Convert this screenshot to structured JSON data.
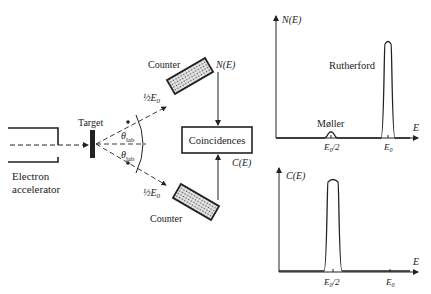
{
  "labels": {
    "target": "Target",
    "accelerator_line1": "Electron",
    "accelerator_line2": "accelerator",
    "counter_top": "Counter",
    "counter_bottom": "Counter",
    "half_e0_top": "½E",
    "half_e0_top_sub": "0",
    "half_e0_bottom": "½E",
    "half_e0_bottom_sub": "0",
    "theta_top": "θ",
    "theta_top_sub": "lab",
    "theta_bottom": "θ",
    "theta_bottom_sub": "lab",
    "ne_signal": "N(E)",
    "ce_signal": "C(E)",
    "coincidences": "Coincidences"
  },
  "chart_data": [
    {
      "type": "line",
      "title": "",
      "ylabel": "N(E)",
      "xlabel": "E",
      "xticks": [
        "E0/2",
        "E0"
      ],
      "annotations": [
        "Møller",
        "Rutherford"
      ],
      "peaks": [
        {
          "name": "Møller",
          "center": "E0/2",
          "relative_height": 0.06
        },
        {
          "name": "Rutherford",
          "center": "E0",
          "relative_height": 1.0
        }
      ]
    },
    {
      "type": "line",
      "title": "",
      "ylabel": "C(E)",
      "xlabel": "E",
      "xticks": [
        "E0/2",
        "E0"
      ],
      "annotations": [],
      "peaks": [
        {
          "name": "coincidence",
          "center": "E0/2",
          "relative_height": 1.0
        }
      ]
    }
  ],
  "chart_text": {
    "top_ylabel": "N(E)",
    "top_xlabel": "E",
    "top_tick_half": "E",
    "top_tick_half_sub": "0",
    "top_tick_half_suffix": "/2",
    "top_tick_full": "E",
    "top_tick_full_sub": "0",
    "moller": "Møller",
    "rutherford": "Rutherford",
    "bottom_ylabel": "C(E)",
    "bottom_xlabel": "E",
    "bottom_tick_half": "E",
    "bottom_tick_half_sub": "0",
    "bottom_tick_half_suffix": "/2",
    "bottom_tick_full": "E",
    "bottom_tick_full_sub": "0"
  }
}
